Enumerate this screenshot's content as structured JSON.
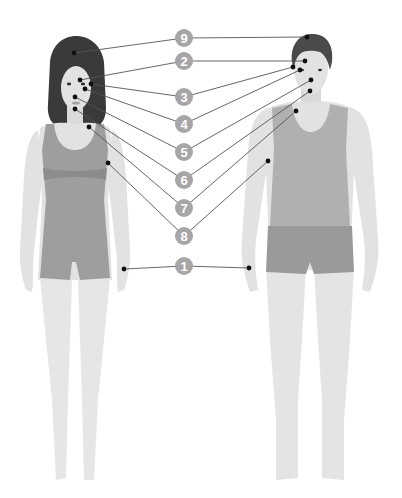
{
  "diagram": {
    "colors": {
      "background": "#ffffff",
      "skin": "#e2e2e2",
      "skin_shade": "#d6d6d6",
      "hair": "#3a3a3a",
      "garment_female": "#9e9e9e",
      "garment_female_band": "#8f8f8f",
      "garment_male_top": "#b0b0b0",
      "garment_male_shorts": "#9a9a9a",
      "badge": "#a6a6a6",
      "badge_text": "#ffffff",
      "line": "#555555",
      "dot": "#111111"
    },
    "figures": [
      {
        "id": "female",
        "label": "Female figure"
      },
      {
        "id": "male",
        "label": "Male figure"
      }
    ],
    "badges": [
      {
        "number": "9",
        "x": 184,
        "y": 38,
        "female_point": [
          74,
          53
        ],
        "male_point": [
          307,
          37
        ],
        "region": "crown of head"
      },
      {
        "number": "2",
        "x": 184,
        "y": 61,
        "female_point": [
          80,
          80
        ],
        "male_point": [
          305,
          61
        ],
        "region": "eyebrow"
      },
      {
        "number": "3",
        "x": 184,
        "y": 97,
        "female_point": [
          91,
          84
        ],
        "male_point": [
          293,
          67
        ],
        "region": "outer eye"
      },
      {
        "number": "4",
        "x": 184,
        "y": 124,
        "female_point": [
          85,
          89
        ],
        "male_point": [
          300,
          70
        ],
        "region": "cheek"
      },
      {
        "number": "5",
        "x": 184,
        "y": 152,
        "female_point": [
          75,
          97
        ],
        "male_point": [
          311,
          80
        ],
        "region": "nose"
      },
      {
        "number": "6",
        "x": 184,
        "y": 180,
        "female_point": [
          75,
          109
        ],
        "male_point": [
          310,
          91
        ],
        "region": "chin"
      },
      {
        "number": "7",
        "x": 184,
        "y": 208,
        "female_point": [
          89,
          127
        ],
        "male_point": [
          296,
          111
        ],
        "region": "neck"
      },
      {
        "number": "8",
        "x": 184,
        "y": 236,
        "female_point": [
          108,
          163
        ],
        "male_point": [
          268,
          161
        ],
        "region": "upper arm"
      },
      {
        "number": "1",
        "x": 184,
        "y": 266,
        "female_point": [
          124,
          269
        ],
        "male_point": [
          249,
          268
        ],
        "region": "wrist"
      }
    ]
  }
}
